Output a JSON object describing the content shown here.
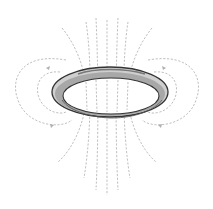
{
  "diagram": {
    "title": "Magnetic field lines around a current loop",
    "colors": {
      "background": "#ffffff",
      "ring_outline": "#3a3a3a",
      "ring_fill": "#c8c8c8",
      "field_lines": "#b8b8b8"
    }
  }
}
